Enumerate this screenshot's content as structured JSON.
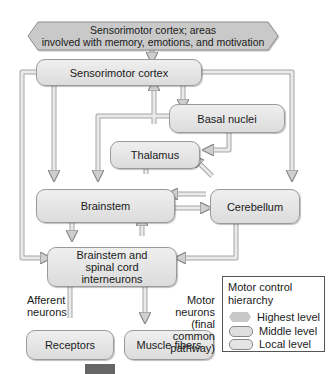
{
  "nodes": {
    "highest": "Sensorimotor cortex; areas involved with memory, emotions, and motivation",
    "highest_line1": "Sensorimotor cortex; areas",
    "highest_line2": "involved with memory, emotions, and motivation",
    "sensorimotor_cortex": "Sensorimotor cortex",
    "basal_nuclei": "Basal nuclei",
    "thalamus": "Thalamus",
    "brainstem": "Brainstem",
    "cerebellum": "Cerebellum",
    "interneurons_line1": "Brainstem and",
    "interneurons_line2": "spinal cord",
    "interneurons_line3": "interneurons",
    "receptors": "Receptors",
    "muscle_fibers": "Muscle fibers"
  },
  "labels": {
    "afferent_line1": "Afferent",
    "afferent_line2": "neurons",
    "motor_line1": "Motor neurons",
    "motor_line2": "(final common",
    "motor_line3": "pathway)"
  },
  "legend": {
    "title_line1": "Motor control",
    "title_line2": "hierarchy",
    "items": [
      {
        "label": "Highest level",
        "shape": "hexagon"
      },
      {
        "label": "Middle level",
        "shape": "rounded-rect"
      },
      {
        "label": "Local level",
        "shape": "rounded-rect"
      }
    ]
  },
  "colors": {
    "box_fill": "#e4e4e4",
    "box_stroke": "#9a9a9a",
    "wire_fill": "#e8e8e8",
    "wire_stroke": "#a0a0a0",
    "legend_border": "#555555"
  }
}
